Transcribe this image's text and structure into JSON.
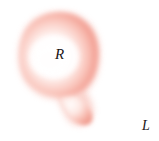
{
  "figure": {
    "background_color": "#ffffff",
    "width": 159,
    "height": 141
  },
  "labels": {
    "region_label": "R",
    "exterior_label": "L"
  },
  "colors": {
    "background": "#ffffff",
    "shape_edge_pink": "#f09a8e",
    "shape_mid_pink": "#f7b5ab",
    "shape_light_pink": "#fbd8d1",
    "shape_core_white": "#fffdfc",
    "label_text": "#1a1517"
  },
  "shape": {
    "name": "blob-region",
    "description": "Soft airbrushed pink closed region with a rounded main lobe and a narrow pendant lobe extending toward the lower right",
    "fill_style": "radial gradient, white core fading to pink rim",
    "outline": "soft, no hard stroke"
  }
}
